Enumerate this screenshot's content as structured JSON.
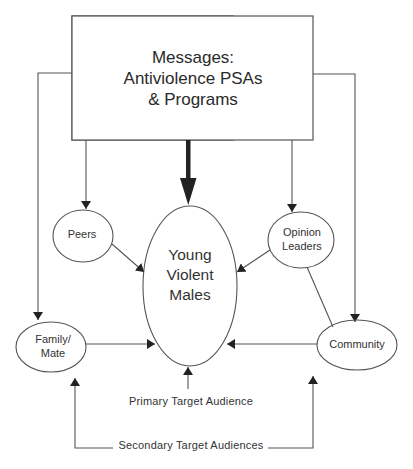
{
  "diagram": {
    "source_box": {
      "line1": "Messages:",
      "line2": "Antiviolence PSAs",
      "line3": "& Programs"
    },
    "nodes": {
      "primary": {
        "line1": "Young",
        "line2": "Violent",
        "line3": "Males"
      },
      "peers": {
        "line1": "Peers"
      },
      "opinion_leaders": {
        "line1": "Opinion",
        "line2": "Leaders"
      },
      "family_mate": {
        "line1": "Family/",
        "line2": "Mate"
      },
      "community": {
        "line1": "Community"
      }
    },
    "captions": {
      "primary": "Primary Target Audience",
      "secondary": "Secondary Target Audiences"
    },
    "footer": "Fig. 11.1. ... ",
    "colors": {
      "stroke": "#555555",
      "text": "#333333",
      "background": "#ffffff"
    }
  }
}
